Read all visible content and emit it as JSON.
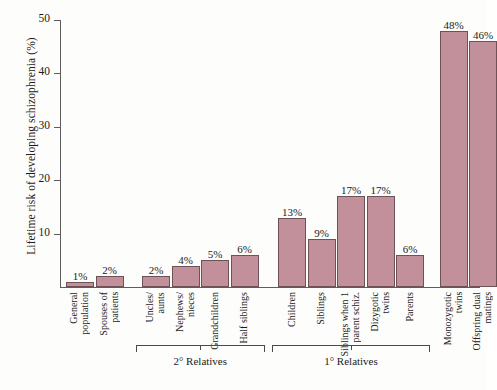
{
  "chart_data": {
    "type": "bar",
    "title": "",
    "xlabel": "",
    "ylabel": "Lifetime risk of developing schizophrenia (%)",
    "ylim": [
      0,
      50
    ],
    "yticks": [
      0,
      10,
      20,
      30,
      40,
      50
    ],
    "ytick_labels": [
      "",
      "10",
      "20",
      "30",
      "40",
      "50"
    ],
    "grid": false,
    "legend": "none",
    "bar_color": "#c1909a",
    "bar_edge_color": "#6f5158",
    "axis_color": "#5d5d5d",
    "categories": [
      "General population",
      "Spouses of patients",
      "Uncles/ aunts",
      "Nephews/ nieces",
      "Grandchildren",
      "Half siblings",
      "Children",
      "Siblings",
      "Siblings when 1 parent schiz.",
      "Dizygotic twins",
      "Parents",
      "Monozygotic twins",
      "Offspring dual matings"
    ],
    "values": [
      1,
      2,
      2,
      4,
      5,
      6,
      13,
      9,
      17,
      17,
      6,
      48,
      46
    ],
    "value_labels": [
      "1%",
      "2%",
      "2%",
      "4%",
      "5%",
      "6%",
      "13%",
      "9%",
      "17%",
      "17%",
      "6%",
      "48%",
      "46%"
    ],
    "annotations": [
      {
        "label": "2° Relatives",
        "span": "Uncles/aunts to Half siblings"
      },
      {
        "label": "1° Relatives",
        "span": "Children to Parents"
      }
    ]
  },
  "bars": [
    {
      "label_lines": [
        "General",
        "population"
      ],
      "value_label": "1%",
      "value": 1
    },
    {
      "label_lines": [
        "Spouses of",
        "patients"
      ],
      "value_label": "2%",
      "value": 2
    },
    {
      "label_lines": [
        "Uncles/",
        "aunts"
      ],
      "value_label": "2%",
      "value": 2
    },
    {
      "label_lines": [
        "Nephews/",
        "nieces"
      ],
      "value_label": "4%",
      "value": 4
    },
    {
      "label_lines": [
        "Grandchildren"
      ],
      "value_label": "5%",
      "value": 5
    },
    {
      "label_lines": [
        "Half siblings"
      ],
      "value_label": "6%",
      "value": 6
    },
    {
      "label_lines": [
        "Children"
      ],
      "value_label": "13%",
      "value": 13
    },
    {
      "label_lines": [
        "Siblings"
      ],
      "value_label": "9%",
      "value": 9
    },
    {
      "label_lines": [
        "Siblings when 1",
        "parent schiz."
      ],
      "value_label": "17%",
      "value": 17
    },
    {
      "label_lines": [
        "Dizygotic",
        "twins"
      ],
      "value_label": "17%",
      "value": 17
    },
    {
      "label_lines": [
        "Parents"
      ],
      "value_label": "6%",
      "value": 6
    },
    {
      "label_lines": [
        "Monozygotic",
        "twins"
      ],
      "value_label": "48%",
      "value": 48
    },
    {
      "label_lines": [
        "Offspring dual",
        "matings"
      ],
      "value_label": "46%",
      "value": 46
    }
  ],
  "yaxis": {
    "title": "Lifetime risk of developing schizophrenia (%)",
    "ticks": [
      "10",
      "20",
      "30",
      "40",
      "50"
    ]
  },
  "brackets": [
    {
      "label": "2° Relatives"
    },
    {
      "label": "1° Relatives"
    }
  ]
}
